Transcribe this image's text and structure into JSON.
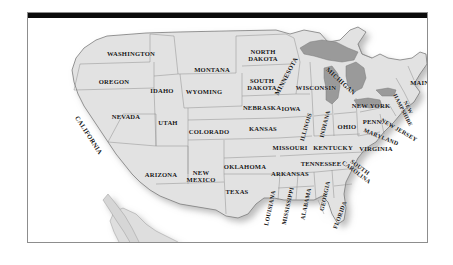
{
  "document": {
    "type": "map-figure",
    "title": "United States political map with state names",
    "background_color": "#ffffff",
    "frame": {
      "border_color": "#8d8d8d",
      "top_bar_color": "#0b0b0b",
      "has_drop_shadow": true
    }
  },
  "map": {
    "region": "Contiguous United States",
    "style": "grayscale",
    "colors": {
      "land": "#e2e2e2",
      "land_shadow": "#cfcfcf",
      "state_border": "#8f8f8f",
      "outer_border": "#6b6b6b",
      "great_lakes": "#9a9a9a",
      "great_lakes_border": "#7b7b7b",
      "ocean": "#ffffff",
      "label_text": "#141414"
    },
    "features": [
      {
        "name": "great-lakes",
        "label": "Great Lakes",
        "shown": true
      },
      {
        "name": "state-boundaries",
        "label": "State boundaries",
        "shown": true
      },
      {
        "name": "mexico-baja",
        "label": "Baja California peninsula",
        "shown": true
      }
    ],
    "labels": [
      {
        "name": "washington",
        "text": "WASHINGTON",
        "x": 103,
        "y": 35,
        "rotate": 0,
        "size": "normal"
      },
      {
        "name": "oregon",
        "text": "OREGON",
        "x": 86,
        "y": 63,
        "rotate": 0,
        "size": "normal"
      },
      {
        "name": "idaho",
        "text": "IDAHO",
        "x": 134,
        "y": 72,
        "rotate": 0,
        "size": "normal"
      },
      {
        "name": "montana",
        "text": "MONTANA",
        "x": 184,
        "y": 51,
        "rotate": 0,
        "size": "normal"
      },
      {
        "name": "north-dakota",
        "text": "NORTH\nDAKOTA",
        "x": 235,
        "y": 37,
        "rotate": 0,
        "size": "normal"
      },
      {
        "name": "south-dakota",
        "text": "SOUTH\nDAKOTA",
        "x": 234,
        "y": 66,
        "rotate": 0,
        "size": "normal"
      },
      {
        "name": "wyoming",
        "text": "WYOMING",
        "x": 176,
        "y": 73,
        "rotate": 0,
        "size": "normal"
      },
      {
        "name": "nebraska",
        "text": "NEBRASKA",
        "x": 234,
        "y": 89,
        "rotate": 0,
        "size": "normal"
      },
      {
        "name": "nevada",
        "text": "NEVADA",
        "x": 98,
        "y": 98,
        "rotate": 0,
        "size": "normal"
      },
      {
        "name": "utah",
        "text": "UTAH",
        "x": 140,
        "y": 104,
        "rotate": 0,
        "size": "normal"
      },
      {
        "name": "california",
        "text": "CALIFORNIA",
        "x": 61,
        "y": 117,
        "rotate": 57,
        "size": "normal"
      },
      {
        "name": "colorado",
        "text": "COLORADO",
        "x": 181,
        "y": 113,
        "rotate": 0,
        "size": "normal"
      },
      {
        "name": "kansas",
        "text": "KANSAS",
        "x": 235,
        "y": 110,
        "rotate": 0,
        "size": "normal"
      },
      {
        "name": "iowa",
        "text": "IOWA",
        "x": 263,
        "y": 90,
        "rotate": 0,
        "size": "normal"
      },
      {
        "name": "minnesota",
        "text": "MINNESOTA",
        "x": 258,
        "y": 58,
        "rotate": -62,
        "size": "normal"
      },
      {
        "name": "wisconsin",
        "text": "WISCONSIN",
        "x": 288,
        "y": 69,
        "rotate": 0,
        "size": "normal"
      },
      {
        "name": "michigan",
        "text": "MICHIGAN",
        "x": 313,
        "y": 63,
        "rotate": 42,
        "size": "normal"
      },
      {
        "name": "illinois",
        "text": "ILLINOIS",
        "x": 278,
        "y": 109,
        "rotate": -74,
        "size": "sm"
      },
      {
        "name": "indiana",
        "text": "INDIANA",
        "x": 297,
        "y": 106,
        "rotate": -76,
        "size": "sm"
      },
      {
        "name": "ohio",
        "text": "OHIO",
        "x": 319,
        "y": 108,
        "rotate": 0,
        "size": "normal"
      },
      {
        "name": "missouri",
        "text": "MISSOURI",
        "x": 262,
        "y": 129,
        "rotate": 0,
        "size": "normal"
      },
      {
        "name": "kentucky",
        "text": "KENTUCKY",
        "x": 305,
        "y": 129,
        "rotate": 0,
        "size": "normal"
      },
      {
        "name": "tennessee",
        "text": "TENNESSEE",
        "x": 293,
        "y": 145,
        "rotate": 0,
        "size": "normal"
      },
      {
        "name": "arkansas",
        "text": "ARKANSAS",
        "x": 262,
        "y": 155,
        "rotate": 0,
        "size": "normal"
      },
      {
        "name": "oklahoma",
        "text": "OKLAHOMA",
        "x": 217,
        "y": 148,
        "rotate": 0,
        "size": "normal"
      },
      {
        "name": "texas",
        "text": "TEXAS",
        "x": 209,
        "y": 173,
        "rotate": 0,
        "size": "normal"
      },
      {
        "name": "arizona",
        "text": "ARIZONA",
        "x": 133,
        "y": 156,
        "rotate": 0,
        "size": "normal"
      },
      {
        "name": "new-mexico",
        "text": "NEW\nMEXICO",
        "x": 173,
        "y": 158,
        "rotate": 0,
        "size": "normal"
      },
      {
        "name": "louisiana",
        "text": "LOUISIANA",
        "x": 242,
        "y": 190,
        "rotate": -78,
        "size": "sm"
      },
      {
        "name": "mississippi",
        "text": "MISSISSIPPI",
        "x": 260,
        "y": 188,
        "rotate": -78,
        "size": "sm"
      },
      {
        "name": "alabama",
        "text": "ALABAMA",
        "x": 278,
        "y": 186,
        "rotate": -78,
        "size": "sm"
      },
      {
        "name": "georgia",
        "text": "GEORGIA",
        "x": 297,
        "y": 178,
        "rotate": -78,
        "size": "sm"
      },
      {
        "name": "florida",
        "text": "FLORIDA",
        "x": 312,
        "y": 197,
        "rotate": -70,
        "size": "sm"
      },
      {
        "name": "south-carolina",
        "text": "SOUTH\nCAROLINA",
        "x": 330,
        "y": 152,
        "rotate": 37,
        "size": "sm"
      },
      {
        "name": "virginia",
        "text": "VIRGINIA",
        "x": 348,
        "y": 130,
        "rotate": 0,
        "size": "normal"
      },
      {
        "name": "maryland",
        "text": "MARYLAND",
        "x": 353,
        "y": 119,
        "rotate": 22,
        "size": "sm"
      },
      {
        "name": "pennsylvania",
        "text": "PENN.",
        "x": 345,
        "y": 103,
        "rotate": 0,
        "size": "normal"
      },
      {
        "name": "new-jersey",
        "text": "NEW JERSEY",
        "x": 371,
        "y": 112,
        "rotate": 30,
        "size": "sm"
      },
      {
        "name": "new-york",
        "text": "NEW YORK",
        "x": 343,
        "y": 87,
        "rotate": 0,
        "size": "normal"
      },
      {
        "name": "new-hampshire",
        "text": "NEW\nHAMPSHIRE",
        "x": 377,
        "y": 91,
        "rotate": 63,
        "size": "xs"
      },
      {
        "name": "maine",
        "text": "MAINE",
        "x": 394,
        "y": 64,
        "rotate": 0,
        "size": "normal"
      }
    ]
  }
}
